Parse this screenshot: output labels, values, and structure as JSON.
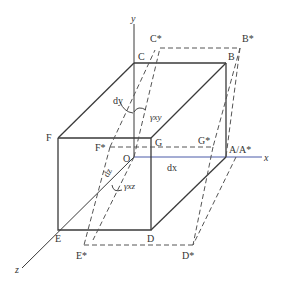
{
  "figure": {
    "axes": {
      "x": "x",
      "y": "y",
      "z": "z"
    },
    "origin": "O",
    "original_vertices": {
      "O": "O",
      "A": "A",
      "B": "B",
      "C": "C",
      "D": "D",
      "E": "E",
      "F": "F",
      "G": "G"
    },
    "deformed_vertices": {
      "A_star": "A*",
      "B_star": "B*",
      "C_star": "C*",
      "D_star": "D*",
      "E_star": "E*",
      "F_star": "F*",
      "G_star": "G*"
    },
    "a_label": "A/A*",
    "dimensions": {
      "dx": "dx",
      "dy": "dy",
      "dz": "dz"
    },
    "shear_strains": {
      "gxy": "γxy",
      "gxz": "γxz"
    },
    "colors": {
      "line": "#3a3a3a",
      "x_axis": "#4a5aa8",
      "dashed": "#555555"
    }
  }
}
